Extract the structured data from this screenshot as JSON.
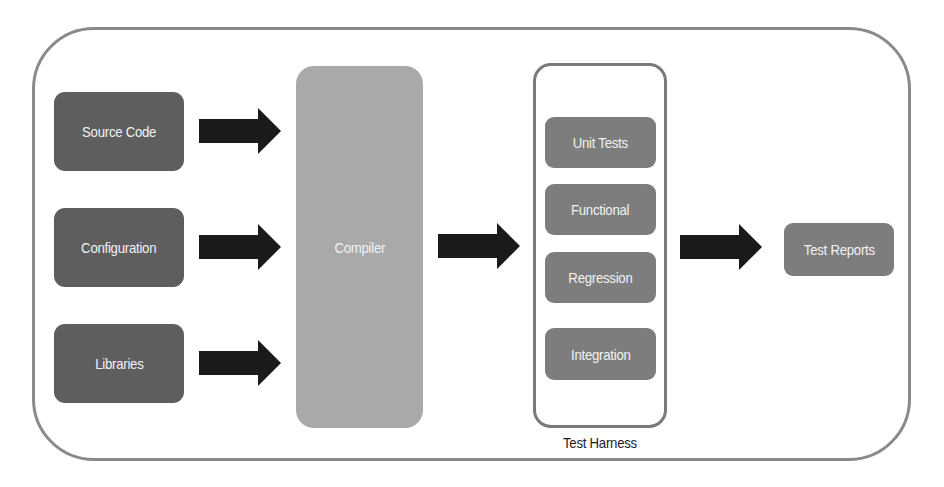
{
  "diagram": {
    "inputs": [
      {
        "label": "Source Code"
      },
      {
        "label": "Configuration"
      },
      {
        "label": "Libraries"
      }
    ],
    "compiler": {
      "label": "Compiler"
    },
    "test_harness": {
      "label": "Test Harness",
      "tests": [
        {
          "label": "Unit Tests"
        },
        {
          "label": "Functional"
        },
        {
          "label": "Regression"
        },
        {
          "label": "Integration"
        }
      ]
    },
    "output": {
      "label": "Test Reports"
    },
    "edges": [
      {
        "from": "Source Code",
        "to": "Compiler"
      },
      {
        "from": "Configuration",
        "to": "Compiler"
      },
      {
        "from": "Libraries",
        "to": "Compiler"
      },
      {
        "from": "Compiler",
        "to": "Test Harness"
      },
      {
        "from": "Test Harness",
        "to": "Test Reports"
      }
    ],
    "colors": {
      "input_box": "#5e5e5e",
      "compiler_box": "#a9a9a9",
      "test_box": "#7d7d7d",
      "arrow": "#1a1a1a",
      "border": "#8a8a8a"
    }
  }
}
